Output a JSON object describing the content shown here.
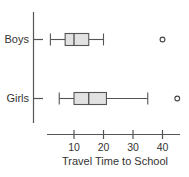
{
  "chart_data": {
    "type": "boxplot",
    "orientation": "horizontal",
    "title": "",
    "xlabel": "Travel Time to School",
    "ylabel": "",
    "xlim": [
      0,
      47
    ],
    "xticks": [
      10,
      20,
      30,
      40
    ],
    "xtick_labels": [
      "10",
      "20",
      "30",
      "40"
    ],
    "grid": false,
    "legend": null,
    "categories": [
      "Boys",
      "Girls"
    ],
    "series": [
      {
        "name": "Boys",
        "whisker_low": 2,
        "q1": 7,
        "median": 10,
        "q3": 15,
        "whisker_high": 20,
        "outliers": [
          40
        ]
      },
      {
        "name": "Girls",
        "whisker_low": 5,
        "q1": 10,
        "median": 15,
        "q3": 21,
        "whisker_high": 35,
        "outliers": [
          45
        ]
      }
    ],
    "colors": {
      "box_fill": "#e2e2e2",
      "stroke": "#555555",
      "text": "#333333"
    }
  }
}
